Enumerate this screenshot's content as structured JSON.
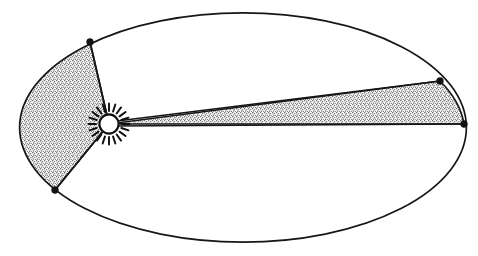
{
  "figure": {
    "name": "kepler-second-law-orbit-diagram",
    "canvas": {
      "width": 478,
      "height": 256,
      "background": "#ffffff"
    },
    "colors": {
      "stroke": "#161616",
      "stipple_fill": "#b9b9b9",
      "sun_fill": "#ffffff",
      "node_fill": "#121212",
      "background": "#ffffff"
    }
  },
  "orbit": {
    "label": "elliptical-orbit",
    "shape": "ellipse",
    "center": {
      "x": 243,
      "y": 127.5
    },
    "semi_major_axis": 224,
    "semi_minor_axis": 115,
    "stroke_width": 1.7
  },
  "sun": {
    "label": "Sun",
    "icon": "sun-icon",
    "center": {
      "x": 109,
      "y": 124
    },
    "disc_radius": 10,
    "ray_inner_radius": 13,
    "ray_outer_radius": 20.5,
    "ray_count": 20,
    "position_note": "located at the left focus of the ellipse"
  },
  "sectors": [
    {
      "id": "perihelion-sector",
      "label": "Sector near Sun (perihelion) — short arc, wide angle",
      "side": "left",
      "fill": "stipple",
      "vertex_start": {
        "x": 90,
        "y": 42
      },
      "vertex_end": {
        "x": 55,
        "y": 190
      },
      "apex": {
        "x": 109,
        "y": 124
      },
      "arc_sweep": "counter-clockwise along orbit from upper node to lower node",
      "area_equal": true
    },
    {
      "id": "aphelion-sector",
      "label": "Sector far from Sun (aphelion) — long arc, narrow angle",
      "side": "right",
      "fill": "stipple",
      "vertex_start": {
        "x": 440,
        "y": 81
      },
      "vertex_end": {
        "x": 464,
        "y": 124
      },
      "apex": {
        "x": 109,
        "y": 124
      },
      "arc_sweep": "clockwise along orbit from upper-right node to right node",
      "area_equal": true
    }
  ],
  "nodes": [
    {
      "id": "node-upper-left",
      "x": 90,
      "y": 42,
      "radius": 3.4
    },
    {
      "id": "node-lower-left",
      "x": 55,
      "y": 190,
      "radius": 3.4
    },
    {
      "id": "node-upper-right",
      "x": 440,
      "y": 81,
      "radius": 3.4
    },
    {
      "id": "node-right",
      "x": 464,
      "y": 124,
      "radius": 3.4
    }
  ],
  "radius_lines": [
    {
      "id": "radius-to-upper-left",
      "from": {
        "x": 109,
        "y": 124
      },
      "to": {
        "x": 90,
        "y": 42
      }
    },
    {
      "id": "radius-to-lower-left",
      "from": {
        "x": 109,
        "y": 124
      },
      "to": {
        "x": 55,
        "y": 190
      }
    },
    {
      "id": "radius-to-upper-right",
      "from": {
        "x": 109,
        "y": 122
      },
      "to": {
        "x": 440,
        "y": 81
      }
    },
    {
      "id": "radius-to-right",
      "from": {
        "x": 109,
        "y": 126
      },
      "to": {
        "x": 464,
        "y": 124
      }
    }
  ]
}
